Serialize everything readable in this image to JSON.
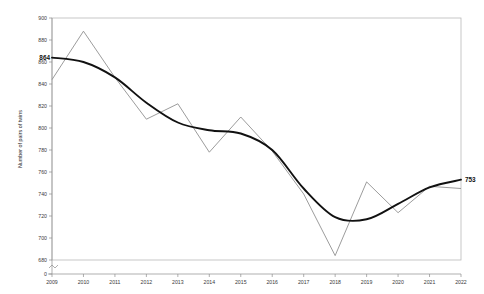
{
  "chart_data": {
    "type": "line",
    "title": "",
    "xlabel": "Time",
    "ylabel": "Number of pairs of twins",
    "categories": [
      "2009",
      "2010",
      "2011",
      "2012",
      "2013",
      "2014",
      "2015",
      "2016",
      "2017",
      "2018",
      "2019",
      "2020",
      "2021",
      "2022"
    ],
    "x": [
      2009,
      2010,
      2011,
      2012,
      2013,
      2014,
      2015,
      2016,
      2017,
      2018,
      2019,
      2020,
      2021,
      2022
    ],
    "xlim": [
      2009,
      2022
    ],
    "ylim": [
      680,
      900
    ],
    "y_axis_break_from_zero": true,
    "y_ticks": [
      0,
      680,
      700,
      720,
      740,
      760,
      780,
      800,
      820,
      840,
      860,
      880,
      900
    ],
    "y_tick_labels": [
      "0",
      "680",
      "700",
      "720",
      "740",
      "760",
      "780",
      "800",
      "820",
      "840",
      "860",
      "880",
      "900"
    ],
    "x_ticks": [
      2009,
      2010,
      2011,
      2012,
      2013,
      2014,
      2015,
      2016,
      2017,
      2018,
      2019,
      2020,
      2021,
      2022
    ],
    "grid": false,
    "legend": "none",
    "series": [
      {
        "name": "Observed",
        "role": "observed-data",
        "color": "#8a8a8a",
        "values": [
          844,
          888,
          846,
          808,
          822,
          778,
          810,
          779,
          740,
          684,
          751,
          723,
          747,
          745
        ]
      },
      {
        "name": "Trend",
        "role": "smoothed-trend",
        "color": "#111111",
        "values": [
          864,
          860,
          846,
          823,
          805,
          798,
          795,
          780,
          745,
          719,
          717,
          731,
          746,
          753
        ]
      }
    ],
    "annotations": [
      {
        "text": "864",
        "x": 2009,
        "y": 864,
        "anchor": "start",
        "bold": true
      },
      {
        "text": "753",
        "x": 2022,
        "y": 753,
        "anchor": "end",
        "bold": true
      }
    ]
  }
}
